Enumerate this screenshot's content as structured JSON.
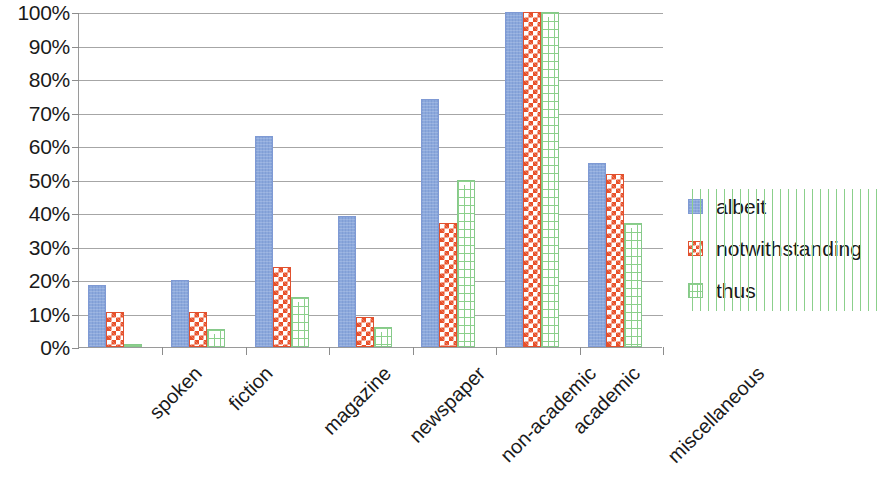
{
  "chart_data": {
    "type": "bar",
    "title": "",
    "subtitle": "",
    "xlabel": "",
    "ylabel": "",
    "ylim": [
      0,
      100
    ],
    "y_tick_labels": [
      "100%",
      "90%",
      "80%",
      "70%",
      "60%",
      "50%",
      "40%",
      "30%",
      "20%",
      "10%",
      "0%"
    ],
    "y_tick_values": [
      100,
      90,
      80,
      70,
      60,
      50,
      40,
      30,
      20,
      10,
      0
    ],
    "grid": true,
    "legend_position": "right",
    "categories": [
      "spoken",
      "fiction",
      "magazine",
      "newspaper",
      "non-academic",
      "academic",
      "miscellaneous"
    ],
    "series": [
      {
        "name": "albeit",
        "color": "#8ba8dc",
        "pattern": "solid",
        "values": [
          18.5,
          20,
          63,
          39,
          74,
          100,
          55
        ]
      },
      {
        "name": "notwithstanding",
        "color": "#e8502a",
        "pattern": "checkerboard",
        "values": [
          10.5,
          10.5,
          24,
          9,
          37,
          100,
          51.5
        ]
      },
      {
        "name": "thus",
        "color": "#8bd08b",
        "pattern": "brick",
        "values": [
          1,
          5.5,
          15,
          6,
          50,
          100,
          37
        ]
      }
    ]
  },
  "axis": {
    "line_color": "#9a9a9a",
    "grid_color": "#a6a6a6"
  },
  "legend": {
    "entries": [
      {
        "label": "albeit"
      },
      {
        "label": "notwithstanding"
      },
      {
        "label": "thus"
      }
    ]
  }
}
